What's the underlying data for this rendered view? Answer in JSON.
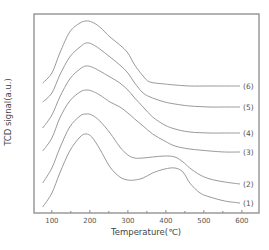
{
  "chart_data": {
    "type": "line",
    "title": "",
    "xlabel": "Temperature(℃)",
    "ylabel": "TCD signal(a.u.)",
    "xlim": [
      53,
      645
    ],
    "ylim": [
      0,
      199
    ],
    "x_ticks": [
      100,
      200,
      300,
      400,
      500,
      600
    ],
    "x_tick_labels": [
      "100",
      "200",
      "300",
      "400",
      "500",
      "600"
    ],
    "x_minor_ticks": [
      150,
      250,
      350,
      450,
      550
    ],
    "y_ticks_shown": false,
    "grid": false,
    "legend": "inline labels at right end of each curve",
    "series": [
      {
        "name": "(1)",
        "x": [
          76,
          100,
          121,
          147,
          174,
          190,
          205,
          226,
          253,
          279,
          300,
          318,
          340,
          365,
          397,
          424,
          445,
          463,
          490,
          516,
          555,
          595
        ],
        "y": [
          6,
          20,
          40,
          62,
          76,
          79,
          76,
          64,
          46,
          36,
          33,
          33,
          35,
          40,
          44,
          45,
          41,
          30,
          20,
          16,
          12,
          10
        ]
      },
      {
        "name": "(2)",
        "x": [
          76,
          100,
          121,
          147,
          174,
          190,
          205,
          226,
          253,
          279,
          300,
          318,
          340,
          365,
          397,
          424,
          445,
          463,
          490,
          516,
          555,
          595
        ],
        "y": [
          30,
          45,
          65,
          86,
          97,
          99,
          98,
          92,
          80,
          66,
          58,
          55,
          55,
          56,
          57,
          56,
          51,
          45,
          38,
          34,
          31,
          29
        ]
      },
      {
        "name": "(3)",
        "x": [
          76,
          100,
          121,
          147,
          174,
          190,
          205,
          226,
          253,
          279,
          300,
          318,
          340,
          365,
          397,
          424,
          463,
          516,
          555,
          595
        ],
        "y": [
          62,
          75,
          95,
          112,
          121,
          123,
          122,
          118,
          111,
          106,
          100,
          94,
          87,
          79,
          72,
          67,
          64,
          62,
          61,
          61
        ]
      },
      {
        "name": "(4)",
        "x": [
          76,
          100,
          121,
          147,
          174,
          190,
          205,
          226,
          253,
          279,
          300,
          318,
          340,
          365,
          397,
          424,
          463,
          516,
          555,
          595
        ],
        "y": [
          85,
          98,
          116,
          134,
          144,
          147,
          146,
          142,
          136,
          130,
          123,
          115,
          106,
          96,
          88,
          84,
          81,
          80,
          80,
          80
        ]
      },
      {
        "name": "(5)",
        "x": [
          76,
          100,
          121,
          147,
          174,
          190,
          205,
          226,
          253,
          279,
          300,
          318,
          340,
          365,
          397,
          424,
          463,
          516,
          555,
          595
        ],
        "y": [
          111,
          120,
          138,
          156,
          166,
          170,
          169,
          164,
          156,
          148,
          140,
          130,
          120,
          115,
          111,
          109,
          107,
          106,
          106,
          106
        ]
      },
      {
        "name": "(6)",
        "x": [
          76,
          100,
          121,
          147,
          174,
          190,
          205,
          226,
          253,
          279,
          300,
          318,
          340,
          358,
          397,
          424,
          463,
          516,
          555,
          595
        ],
        "y": [
          130,
          140,
          160,
          181,
          190,
          192,
          191,
          186,
          176,
          168,
          160,
          148,
          137,
          131,
          129,
          128,
          127,
          127,
          127,
          127
        ]
      }
    ]
  }
}
